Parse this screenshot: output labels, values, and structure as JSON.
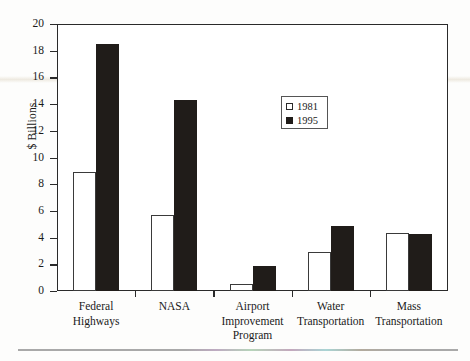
{
  "chart_data": {
    "type": "bar",
    "title": "",
    "xlabel": "",
    "ylabel": "$ Billions",
    "ylim": [
      0,
      20
    ],
    "yticks": [
      0,
      2,
      4,
      6,
      8,
      10,
      12,
      14,
      16,
      18,
      20
    ],
    "grid": false,
    "legend_position": "inside-upper-center",
    "categories": [
      "Federal Highways",
      "NASA",
      "Airport Improvement Program",
      "Water Transportation",
      "Mass Transportation"
    ],
    "category_lines": [
      [
        "Federal",
        "Highways"
      ],
      [
        "NASA"
      ],
      [
        "Airport",
        "Improvement",
        "Program"
      ],
      [
        "Water",
        "Transportation"
      ],
      [
        "Mass",
        "Transportation"
      ]
    ],
    "series": [
      {
        "name": "1981",
        "color": "#ffffff",
        "values": [
          8.9,
          5.7,
          0.5,
          2.9,
          4.35
        ]
      },
      {
        "name": "1995",
        "color": "#201c19",
        "values": [
          18.5,
          14.3,
          1.9,
          4.9,
          4.3
        ]
      }
    ]
  },
  "axis": {
    "y_title": "$ Billions",
    "tick_labels": [
      "0",
      "2",
      "4",
      "6",
      "8",
      "10",
      "12",
      "14",
      "16",
      "18",
      "20"
    ]
  },
  "legend": {
    "entries": [
      {
        "label": "1981",
        "swatch": "open-square"
      },
      {
        "label": "1995",
        "swatch": "filled-square"
      }
    ]
  }
}
